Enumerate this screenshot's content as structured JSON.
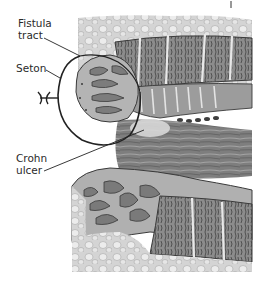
{
  "figure": {
    "style": "grayscale anatomical illustration",
    "colors": {
      "background": "#ffffff",
      "outline": "#2a2a2a",
      "tissue_dark": "#6e6e6e",
      "tissue_mid": "#9a9a9a",
      "tissue_light": "#c8c8c8",
      "fat_light": "#dcdcdc",
      "lumen": "#8a8a8a"
    }
  },
  "labels": {
    "fistula_tract": "Fistula\ntract",
    "seton": "Seton",
    "crohn_ulcer": "Crohn\nulcer"
  },
  "icons": {
    "seton_knot": "knot-icon"
  }
}
